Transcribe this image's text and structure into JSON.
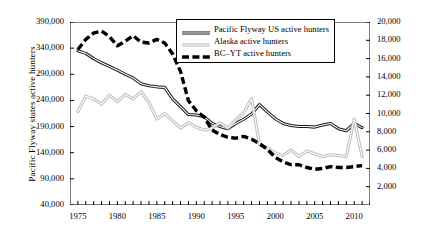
{
  "chart_data": {
    "type": "line",
    "title": "",
    "xlabel": "",
    "ylabel": "Pacific Flyway  states active hunters",
    "ylabel_right": "Alaska, BC, Yukon active hunters",
    "xlim": [
      1974,
      2012
    ],
    "ylim": [
      40000,
      390000
    ],
    "ylim_right": [
      0,
      20000
    ],
    "grid": false,
    "legend_position": "top-center",
    "x_tick_labels": [
      "1975",
      "1980",
      "1985",
      "1990",
      "1995",
      "2000",
      "2005",
      "2010"
    ],
    "x_tick_values": [
      1975,
      1980,
      1985,
      1990,
      1995,
      2000,
      2005,
      2010
    ],
    "y_tick_labels": [
      "40,000",
      "90,000",
      "140,000",
      "190,000",
      "240,000",
      "290,000",
      "340,000",
      "390,000"
    ],
    "y_tick_values": [
      40000,
      90000,
      140000,
      190000,
      240000,
      290000,
      340000,
      390000
    ],
    "y_right_tick_labels": [
      "2,000",
      "4,000",
      "6,000",
      "8,000",
      "10,000",
      "12,000",
      "14,000",
      "16,000",
      "18,000",
      "20,000"
    ],
    "y_right_tick_values": [
      2000,
      4000,
      6000,
      8000,
      10000,
      12000,
      14000,
      16000,
      18000,
      20000
    ],
    "x": [
      1975,
      1976,
      1977,
      1978,
      1979,
      1980,
      1981,
      1982,
      1983,
      1984,
      1985,
      1986,
      1987,
      1988,
      1989,
      1990,
      1991,
      1992,
      1993,
      1994,
      1995,
      1996,
      1997,
      1998,
      1999,
      2000,
      2001,
      2002,
      2003,
      2004,
      2005,
      2006,
      2007,
      2008,
      2009,
      2010,
      2011
    ],
    "series": [
      {
        "name": "Pacific Flyway US active hunters",
        "axis": "left",
        "color": "#1a1a1a",
        "style": "solid",
        "values": [
          335000,
          330000,
          320000,
          312000,
          305000,
          298000,
          290000,
          283000,
          272000,
          268000,
          266000,
          265000,
          243000,
          228000,
          213000,
          212000,
          209000,
          196000,
          190000,
          186000,
          196000,
          204000,
          214000,
          232000,
          218000,
          205000,
          196000,
          192000,
          190000,
          190000,
          189000,
          193000,
          196000,
          186000,
          182000,
          196000,
          188000
        ]
      },
      {
        "name": "Alaska active hunters",
        "axis": "right",
        "color": "#bcbcbc",
        "style": "solid",
        "values": [
          10200,
          11900,
          11600,
          11000,
          12000,
          11300,
          12100,
          11600,
          12400,
          11200,
          9400,
          10000,
          9200,
          8400,
          9000,
          8500,
          8200,
          8400,
          9000,
          8400,
          9300,
          10100,
          11600,
          6600,
          6200,
          5700,
          5400,
          6000,
          5300,
          5900,
          5600,
          5300,
          5500,
          5400,
          5300,
          9400,
          5300
        ]
      },
      {
        "name": "BC–YT active hunters",
        "axis": "right",
        "color": "#000000",
        "style": "dashed",
        "values": [
          17000,
          18100,
          18800,
          19000,
          18400,
          17400,
          17900,
          18500,
          17800,
          17700,
          18100,
          17700,
          16500,
          14600,
          11400,
          10300,
          9600,
          8200,
          7700,
          7400,
          7300,
          7500,
          7200,
          6700,
          6100,
          5200,
          4700,
          4400,
          4400,
          4100,
          3900,
          4000,
          4200,
          4100,
          4100,
          4200,
          4300
        ]
      }
    ]
  },
  "legend": {
    "items": [
      {
        "label": "Pacific Flyway US active hunters",
        "style": "solid-black"
      },
      {
        "label": "Alaska active hunters",
        "style": "solid-gray"
      },
      {
        "label": "BC–YT active hunters",
        "style": "dashed-black"
      }
    ]
  }
}
